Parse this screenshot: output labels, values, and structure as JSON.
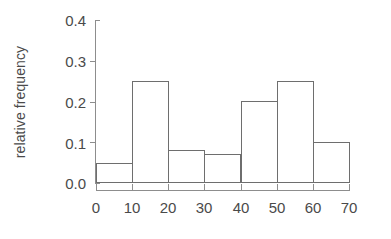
{
  "chart_data": {
    "type": "bar",
    "title": "",
    "subtitle": "",
    "xlabel": "",
    "ylabel": "relative frequency",
    "grid": false,
    "legend": false,
    "legend_position": "none",
    "bin_edges": [
      0,
      10,
      20,
      30,
      40,
      50,
      60,
      70
    ],
    "categories": [
      "0-10",
      "10-20",
      "20-30",
      "30-40",
      "40-50",
      "50-60",
      "60-70"
    ],
    "values": [
      0.05,
      0.25,
      0.08,
      0.07,
      0.2,
      0.25,
      0.1
    ],
    "xlim": [
      0,
      70
    ],
    "ylim": [
      0.0,
      0.4
    ],
    "xticks": [
      0,
      10,
      20,
      30,
      40,
      50,
      60,
      70
    ],
    "xtick_labels": [
      "0",
      "10",
      "20",
      "30",
      "40",
      "50",
      "60",
      "70"
    ],
    "yticks": [
      0.0,
      0.1,
      0.2,
      0.3,
      0.4
    ],
    "ytick_labels": [
      "0.0",
      "0.1",
      "0.2",
      "0.3",
      "0.4"
    ],
    "bar_fill_color": "#ffffff",
    "bar_edge_color": "#6e6e6e",
    "axis_color": "#8d8d8d",
    "text_color": "#4a4a4a",
    "background_color": "#ffffff"
  }
}
